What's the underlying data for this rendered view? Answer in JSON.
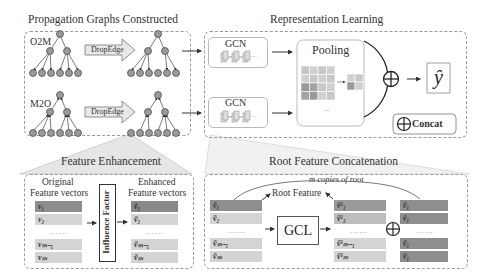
{
  "sections": {
    "propagation": {
      "title": "Propagation Graphs Constructed",
      "o2m_label": "O2M",
      "m2o_label": "M2O",
      "dropedge_label_1": "DropEdge",
      "dropedge_label_2": "DropEdge"
    },
    "representation": {
      "title": "Representation Learning",
      "gcn_label_1": "GCN",
      "gcn_label_2": "GCN",
      "pooling_label": "Pooling",
      "pooling_ellipsis": "...",
      "output_label": "ŷ",
      "concat_legend": "Concat"
    },
    "feature_enhancement": {
      "title": "Feature Enhancement",
      "original_label_1": "Original",
      "original_label_2": "Feature vectors",
      "enhanced_label_1": "Enhanced",
      "enhanced_label_2": "Feature vectors",
      "influence_factor": "Influence Factor",
      "original_vectors": [
        "v₁",
        "v₂",
        "vₘ₋₁",
        "vₘ"
      ],
      "enhanced_vectors": [
        "ṽ₁",
        "ṽ₂",
        "ṽₘ₋₁",
        "ṽₘ"
      ],
      "ellipsis": "……"
    },
    "root_concat": {
      "title": "Root Feature Concatenation",
      "copies_label": "m copies of root",
      "root_feature_label": "Root Feature",
      "gcl_label": "GCL",
      "input_vectors": [
        "ṽ₁",
        "ṽ₂",
        "ṽₘ₋₁",
        "ṽₘ"
      ],
      "gcl_vectors": [
        "ṽ¹₁",
        "ṽ¹₂",
        "ṽ¹ₘ₋₁",
        "ṽ¹ₘ"
      ],
      "root_copies": [
        "ṽ₁",
        "ṽ₁",
        "ṽ₁",
        "ṽ₁"
      ],
      "ellipsis": "……"
    }
  },
  "colors": {
    "node_fill": "#9a9a9a",
    "vector_dark": "#8e8e8e",
    "vector_light": "#d4d4d4",
    "dashed_border": "#9a9a9a",
    "callout_fill": "#e6e6e6"
  }
}
